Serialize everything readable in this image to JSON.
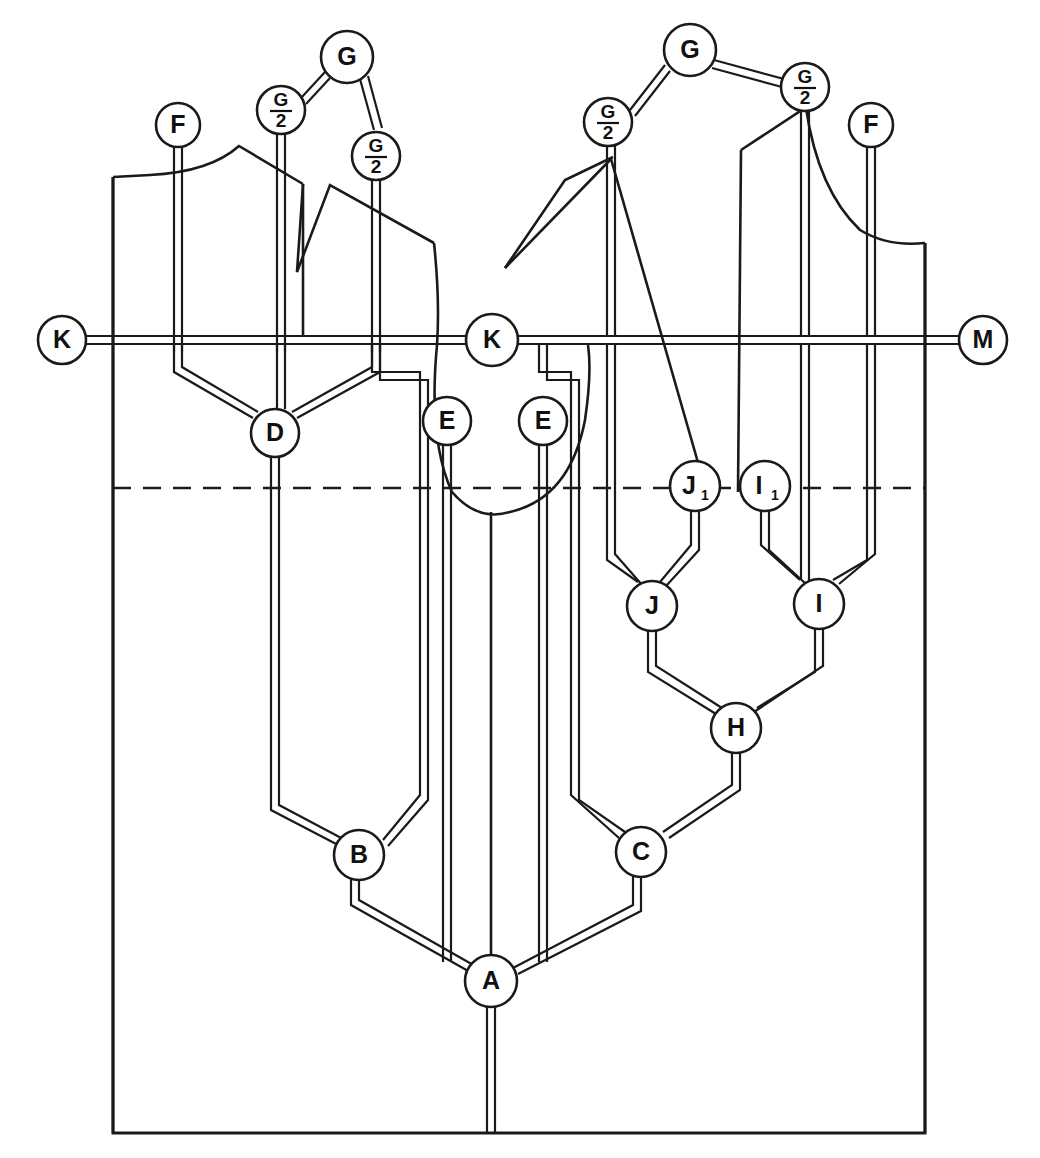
{
  "diagram": {
    "title": "Pattern block schematic with lettered reference nodes",
    "type": "technical-line-diagram",
    "stroke_color": "#1a1a1a",
    "background_color": "#ffffff",
    "width": 1040,
    "height": 1158
  },
  "nodes": [
    {
      "id": "F-left",
      "label": "F",
      "sub": "",
      "kind": "letter",
      "cx": 178,
      "cy": 125,
      "r": 22
    },
    {
      "id": "G2-left",
      "label": "G",
      "sub": "2",
      "kind": "fraction",
      "cx": 281,
      "cy": 110,
      "r": 24
    },
    {
      "id": "G-left",
      "label": "G",
      "sub": "",
      "kind": "letter",
      "cx": 347,
      "cy": 57,
      "r": 26
    },
    {
      "id": "G2-left-2",
      "label": "G",
      "sub": "2",
      "kind": "fraction",
      "cx": 376,
      "cy": 156,
      "r": 24
    },
    {
      "id": "G2-right",
      "label": "G",
      "sub": "2",
      "kind": "fraction",
      "cx": 608,
      "cy": 122,
      "r": 24
    },
    {
      "id": "G-right",
      "label": "G",
      "sub": "",
      "kind": "letter",
      "cx": 690,
      "cy": 50,
      "r": 26
    },
    {
      "id": "G2-right-2",
      "label": "G",
      "sub": "2",
      "kind": "fraction",
      "cx": 805,
      "cy": 87,
      "r": 24
    },
    {
      "id": "F-right",
      "label": "F",
      "sub": "",
      "kind": "letter",
      "cx": 871,
      "cy": 125,
      "r": 22
    },
    {
      "id": "K-left",
      "label": "K",
      "sub": "",
      "kind": "letter",
      "cx": 62,
      "cy": 340,
      "r": 24
    },
    {
      "id": "K-mid",
      "label": "K",
      "sub": "",
      "kind": "letter",
      "cx": 492,
      "cy": 340,
      "r": 26
    },
    {
      "id": "M-right",
      "label": "M",
      "sub": "",
      "kind": "letter",
      "cx": 983,
      "cy": 340,
      "r": 24
    },
    {
      "id": "D",
      "label": "D",
      "sub": "",
      "kind": "letter",
      "cx": 275,
      "cy": 433,
      "r": 24
    },
    {
      "id": "E-left",
      "label": "E",
      "sub": "",
      "kind": "letter",
      "cx": 447,
      "cy": 421,
      "r": 24
    },
    {
      "id": "E-right",
      "label": "E",
      "sub": "",
      "kind": "letter",
      "cx": 543,
      "cy": 421,
      "r": 24
    },
    {
      "id": "J1",
      "label": "J",
      "sub": "1",
      "kind": "letter",
      "cx": 695,
      "cy": 486,
      "r": 25
    },
    {
      "id": "I1",
      "label": "I",
      "sub": "1",
      "kind": "letter",
      "cx": 765,
      "cy": 486,
      "r": 25
    },
    {
      "id": "J",
      "label": "J",
      "sub": "",
      "kind": "letter",
      "cx": 652,
      "cy": 606,
      "r": 25
    },
    {
      "id": "I",
      "label": "I",
      "sub": "",
      "kind": "letter",
      "cx": 819,
      "cy": 604,
      "r": 25
    },
    {
      "id": "H",
      "label": "H",
      "sub": "",
      "kind": "letter",
      "cx": 736,
      "cy": 728,
      "r": 25
    },
    {
      "id": "B",
      "label": "B",
      "sub": "",
      "kind": "letter",
      "cx": 359,
      "cy": 855,
      "r": 25
    },
    {
      "id": "C",
      "label": "C",
      "sub": "",
      "kind": "letter",
      "cx": 641,
      "cy": 852,
      "r": 25
    },
    {
      "id": "A",
      "label": "A",
      "sub": "",
      "kind": "letter",
      "cx": 491,
      "cy": 981,
      "r": 26
    }
  ],
  "guides": {
    "horizontal_rail_y": 340,
    "dashed_line_y": 488,
    "dashed_line_x_start": 113,
    "dashed_line_x_end": 925,
    "frame_left": 113,
    "frame_right": 925,
    "frame_bottom": 1133
  },
  "legend": {
    "letters": [
      "A",
      "B",
      "C",
      "D",
      "E",
      "F",
      "G",
      "H",
      "I",
      "J",
      "K",
      "M"
    ],
    "fraction_label": "G/2",
    "subscripts": [
      "1"
    ]
  }
}
